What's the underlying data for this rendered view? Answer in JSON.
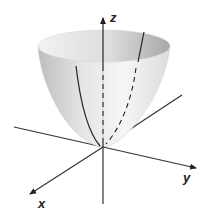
{
  "figure": {
    "axes": {
      "z_label": "z",
      "y_label": "y",
      "x_label": "x"
    },
    "colors": {
      "surface_light": "#f4f4f4",
      "surface_dark": "#b8b8b8",
      "axis": "#333333",
      "curve": "#222222"
    }
  }
}
